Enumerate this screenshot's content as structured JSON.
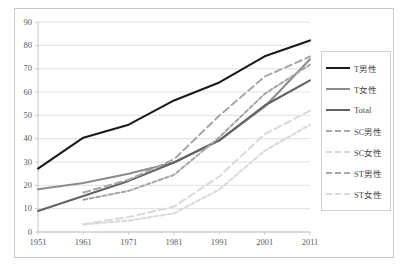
{
  "chart_data": {
    "type": "line",
    "title": "",
    "xlabel": "",
    "ylabel": "",
    "x": [
      1951,
      1961,
      1971,
      1981,
      1991,
      2001,
      2011
    ],
    "xtick_labels": [
      "1951",
      "1961",
      "1971",
      "1981",
      "1991",
      "2001",
      "2011"
    ],
    "ytick_labels": [
      "0",
      "10",
      "20",
      "30",
      "40",
      "50",
      "60",
      "70",
      "80",
      "90"
    ],
    "ylim": [
      0,
      90
    ],
    "ytick_step": 10,
    "xlim": [
      1951,
      2011
    ],
    "grid": "horizontal",
    "legend_position": "right",
    "series": [
      {
        "name": "T男性",
        "color": "#1a1a1a",
        "style": "solid",
        "x": [
          1951,
          1961,
          1971,
          1981,
          1991,
          2001,
          2011
        ],
        "values": [
          27.2,
          40.4,
          46.0,
          56.4,
          64.1,
          75.3,
          82.1
        ]
      },
      {
        "name": "T女性",
        "color": "#8c8c8c",
        "style": "solid",
        "x": [
          1951,
          1961,
          1971,
          1981,
          1991,
          2001,
          2011
        ],
        "values": [
          18.3,
          21.0,
          25.0,
          29.8,
          39.3,
          53.7,
          74.0
        ]
      },
      {
        "name": "Total",
        "color": "#636363",
        "style": "solid",
        "x": [
          1951,
          1961,
          1971,
          1981,
          1991,
          2001,
          2011
        ],
        "values": [
          9.0,
          15.4,
          21.9,
          29.8,
          39.3,
          54.2,
          65.0
        ]
      },
      {
        "name": "SC男性",
        "color": "#a6a6a6",
        "style": "dashed-long",
        "x": [
          1961,
          1971,
          1981,
          1991,
          2001,
          2011
        ],
        "values": [
          16.9,
          22.4,
          31.1,
          49.9,
          66.6,
          75.2
        ]
      },
      {
        "name": "SC女性",
        "color": "#d9d9d9",
        "style": "dashed-long",
        "x": [
          1961,
          1971,
          1981,
          1991,
          2001,
          2011
        ],
        "values": [
          3.3,
          6.4,
          10.9,
          23.8,
          41.9,
          52.0
        ]
      },
      {
        "name": "ST男性",
        "color": "#a6a6a6",
        "style": "dashed-short",
        "x": [
          1961,
          1971,
          1981,
          1991,
          2001,
          2011
        ],
        "values": [
          13.8,
          17.6,
          24.5,
          40.6,
          59.2,
          71.7
        ]
      },
      {
        "name": "ST女性",
        "color": "#d9d9d9",
        "style": "dashed-short",
        "x": [
          1961,
          1971,
          1981,
          1991,
          2001,
          2011
        ],
        "values": [
          3.2,
          4.9,
          8.0,
          18.2,
          34.8,
          46.0
        ]
      }
    ]
  }
}
